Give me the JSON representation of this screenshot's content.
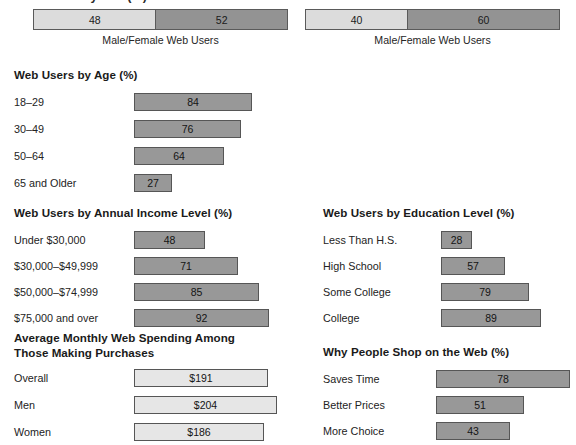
{
  "clipped_title": "Web Users by Sex (%)",
  "colors": {
    "bar_dark": "#989898",
    "bar_light": "#e6e6e6",
    "stack_light": "#dcdcdc",
    "stack_dark": "#939393",
    "border": "#565656",
    "text": "#232323"
  },
  "stacked": [
    {
      "caption": "Male/Female Web Users",
      "segments": [
        {
          "label": "48",
          "value": 48,
          "shade": "light"
        },
        {
          "label": "52",
          "value": 52,
          "shade": "dark"
        }
      ]
    },
    {
      "caption": "Male/Female Web Users",
      "segments": [
        {
          "label": "40",
          "value": 40,
          "shade": "light"
        },
        {
          "label": "60",
          "value": 60,
          "shade": "dark"
        }
      ]
    }
  ],
  "sections": {
    "age": {
      "title": "Web Users by Age (%)",
      "rows": [
        {
          "label": "18–29",
          "value": 84,
          "display": "84"
        },
        {
          "label": "30–49",
          "value": 76,
          "display": "76"
        },
        {
          "label": "50–64",
          "value": 64,
          "display": "64"
        },
        {
          "label": "65 and Older",
          "value": 27,
          "display": "27"
        }
      ]
    },
    "income": {
      "title": "Web Users by Annual Income Level (%)",
      "rows": [
        {
          "label": "Under $30,000",
          "value": 48,
          "display": "48"
        },
        {
          "label": "$30,000–$49,999",
          "value": 71,
          "display": "71"
        },
        {
          "label": "$50,000–$74,999",
          "value": 85,
          "display": "85"
        },
        {
          "label": "$75,000 and over",
          "value": 92,
          "display": "92"
        }
      ]
    },
    "education": {
      "title": "Web Users by Education Level (%)",
      "rows": [
        {
          "label": "Less Than H.S.",
          "value": 28,
          "display": "28"
        },
        {
          "label": "High School",
          "value": 57,
          "display": "57"
        },
        {
          "label": "Some College",
          "value": 79,
          "display": "79"
        },
        {
          "label": "College",
          "value": 89,
          "display": "89"
        }
      ]
    },
    "spending": {
      "title": "Average Monthly Web Spending Among\nThose Making Purchases",
      "rows": [
        {
          "label": "Overall",
          "value": 191,
          "display": "$191"
        },
        {
          "label": "Men",
          "value": 204,
          "display": "$204"
        },
        {
          "label": "Women",
          "value": 186,
          "display": "$186"
        }
      ]
    },
    "shopping": {
      "title": "Why People Shop on the Web (%)",
      "rows": [
        {
          "label": "Saves Time",
          "value": 78,
          "display": "78"
        },
        {
          "label": "Better Prices",
          "value": 51,
          "display": "51"
        },
        {
          "label": "More Choice",
          "value": 43,
          "display": "43"
        }
      ]
    }
  },
  "chart_data": [
    {
      "type": "bar",
      "title": "Male/Female Web Users",
      "orientation": "stacked-horizontal",
      "categories": [
        "Male",
        "Female"
      ],
      "values": [
        48,
        52
      ],
      "xlabel": "",
      "ylabel": "",
      "ylim": [
        0,
        100
      ]
    },
    {
      "type": "bar",
      "title": "Male/Female Web Users",
      "orientation": "stacked-horizontal",
      "categories": [
        "Male",
        "Female"
      ],
      "values": [
        40,
        60
      ],
      "xlabel": "",
      "ylabel": "",
      "ylim": [
        0,
        100
      ]
    },
    {
      "type": "bar",
      "title": "Web Users by Age (%)",
      "orientation": "horizontal",
      "categories": [
        "18–29",
        "30–49",
        "50–64",
        "65 and Older"
      ],
      "values": [
        84,
        76,
        64,
        27
      ],
      "xlabel": "Percent",
      "ylabel": "Age group",
      "xlim": [
        0,
        100
      ]
    },
    {
      "type": "bar",
      "title": "Web Users by Annual Income Level (%)",
      "orientation": "horizontal",
      "categories": [
        "Under $30,000",
        "$30,000–$49,999",
        "$50,000–$74,999",
        "$75,000 and over"
      ],
      "values": [
        48,
        71,
        85,
        92
      ],
      "xlabel": "Percent",
      "ylabel": "Income level",
      "xlim": [
        0,
        100
      ]
    },
    {
      "type": "bar",
      "title": "Web Users by Education Level (%)",
      "orientation": "horizontal",
      "categories": [
        "Less Than H.S.",
        "High School",
        "Some College",
        "College"
      ],
      "values": [
        28,
        57,
        79,
        89
      ],
      "xlabel": "Percent",
      "ylabel": "Education level",
      "xlim": [
        0,
        100
      ]
    },
    {
      "type": "bar",
      "title": "Average Monthly Web Spending Among Those Making Purchases",
      "orientation": "horizontal",
      "categories": [
        "Overall",
        "Men",
        "Women"
      ],
      "values": [
        191,
        204,
        186
      ],
      "value_labels": [
        "$191",
        "$204",
        "$186"
      ],
      "xlabel": "Dollars",
      "ylabel": "",
      "xlim": [
        0,
        230
      ]
    },
    {
      "type": "bar",
      "title": "Why People Shop on the Web (%)",
      "orientation": "horizontal",
      "categories": [
        "Saves Time",
        "Better Prices",
        "More Choice"
      ],
      "values": [
        78,
        51,
        43
      ],
      "xlabel": "Percent",
      "ylabel": "",
      "xlim": [
        0,
        100
      ]
    }
  ]
}
